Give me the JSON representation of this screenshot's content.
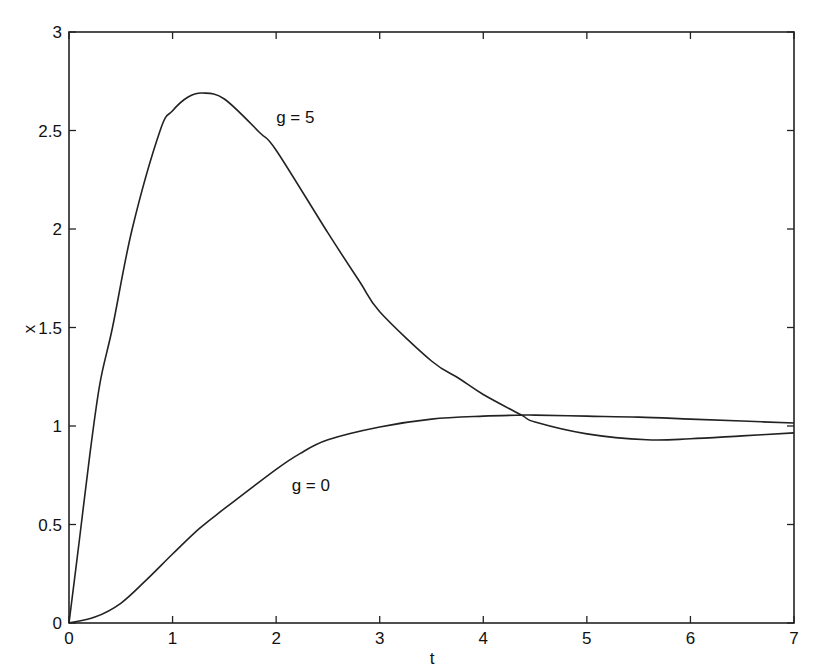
{
  "chart_data": {
    "type": "line",
    "title": "",
    "xlabel": "t",
    "ylabel": "x",
    "xlim": [
      0,
      7
    ],
    "ylim": [
      0,
      3
    ],
    "grid": false,
    "legend": null,
    "x_ticks": [
      0,
      1,
      2,
      3,
      4,
      5,
      6,
      7
    ],
    "x_tick_labels": [
      "0",
      "1",
      "2",
      "3",
      "4",
      "5",
      "6",
      "7"
    ],
    "y_ticks": [
      0,
      0.5,
      1,
      1.5,
      2,
      2.5,
      3
    ],
    "y_tick_labels": [
      "0",
      "0.5",
      "1",
      "1.5",
      "2",
      "2.5",
      "3"
    ],
    "series": [
      {
        "name": "g = 5",
        "color": "#222222",
        "x": [
          0,
          0.1,
          0.2,
          0.3,
          0.42,
          0.61,
          0.88,
          1.0,
          1.15,
          1.29,
          1.5,
          1.84,
          2.0,
          2.5,
          2.81,
          3.0,
          3.5,
          3.77,
          4.0,
          4.37,
          4.5,
          5.0,
          5.58,
          6.0,
          6.5,
          7.0
        ],
        "values": [
          0,
          0.42,
          0.85,
          1.22,
          1.5,
          2.0,
          2.5,
          2.6,
          2.67,
          2.69,
          2.66,
          2.49,
          2.4,
          1.98,
          1.73,
          1.58,
          1.33,
          1.24,
          1.16,
          1.055,
          1.02,
          0.96,
          0.93,
          0.935,
          0.95,
          0.965
        ]
      },
      {
        "name": "g = 0",
        "color": "#222222",
        "x": [
          0,
          0.25,
          0.5,
          0.75,
          1.0,
          1.26,
          1.5,
          2.0,
          2.23,
          2.5,
          3.0,
          3.5,
          4.0,
          4.37,
          4.5,
          5.0,
          5.5,
          6.0,
          6.5,
          7.0
        ],
        "values": [
          0,
          0.03,
          0.1,
          0.22,
          0.35,
          0.48,
          0.58,
          0.78,
          0.86,
          0.93,
          0.995,
          1.035,
          1.05,
          1.055,
          1.055,
          1.05,
          1.045,
          1.035,
          1.025,
          1.015
        ]
      }
    ],
    "annotations": [
      {
        "text": "g = 5",
        "x": 2.0,
        "y": 2.54
      },
      {
        "text": "g = 0",
        "x": 2.15,
        "y": 0.67
      }
    ]
  }
}
